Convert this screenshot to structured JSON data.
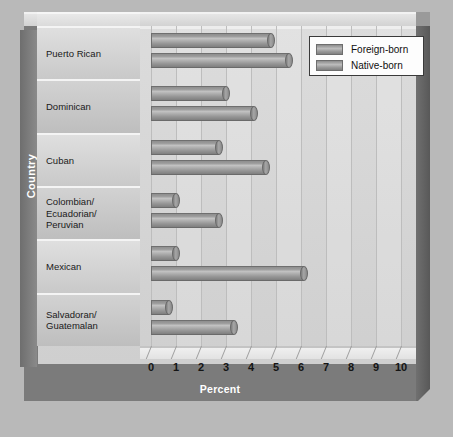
{
  "chart_data": {
    "type": "bar",
    "orientation": "horizontal",
    "title": "",
    "xlabel": "Percent",
    "ylabel": "Country",
    "xlim": [
      0,
      10
    ],
    "xticks": [
      0,
      1,
      2,
      3,
      4,
      5,
      6,
      7,
      8,
      9,
      10
    ],
    "xtick_labels": [
      "0",
      "1",
      "2",
      "3",
      "4",
      "5",
      "6",
      "7",
      "8",
      "9",
      "10"
    ],
    "grid": true,
    "legend_position": "top-right",
    "categories": [
      "Puerto Rican",
      "Dominican",
      "Cuban",
      "Colombian/\nEcuadorian/\nPeruvian",
      "Mexican",
      "Salvadoran/\nGuatemalan"
    ],
    "series": [
      {
        "name": "Foreign-born",
        "color": "#9b9b9b",
        "values": [
          4.8,
          3.0,
          2.7,
          1.0,
          1.0,
          0.7
        ]
      },
      {
        "name": "Native-born",
        "color": "#9b9b9b",
        "values": [
          5.5,
          4.1,
          4.6,
          2.7,
          6.1,
          3.3
        ]
      }
    ]
  },
  "axes": {
    "x_title": "Percent",
    "y_title": "Country"
  },
  "legend": {
    "entries": [
      {
        "label": "Foreign-born"
      },
      {
        "label": "Native-born"
      }
    ]
  },
  "colors": {
    "background": "#b9b9b9",
    "frame": "#7b7b7b",
    "wall": "#d4d4d4",
    "bar": "#9b9b9b",
    "text": "#141414",
    "title_text": "#ffffff"
  }
}
